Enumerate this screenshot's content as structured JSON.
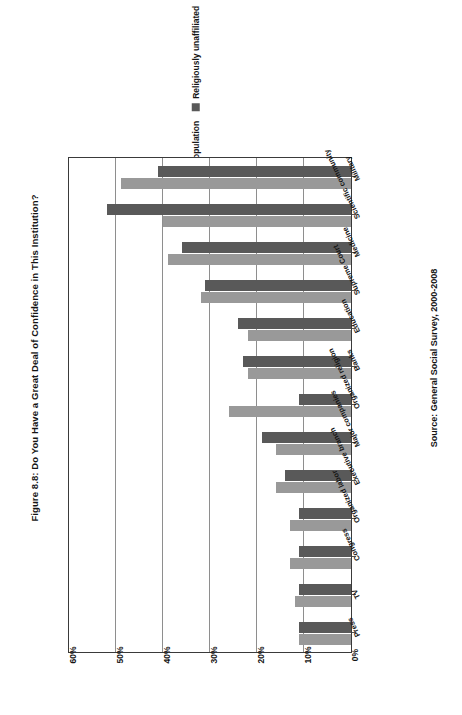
{
  "figure": {
    "title": "Figure 8.8: Do You Have a Great Deal of Confidence in This Institution?",
    "source": "Source: General Social Survey, 2000-2008"
  },
  "legend": {
    "position": "top-center-rotated",
    "items": [
      {
        "label": "General population",
        "color": "#999999"
      },
      {
        "label": "Religiously unaffiliated",
        "color": "#595959"
      }
    ]
  },
  "chart_data": {
    "type": "bar",
    "orientation": "rotated-horizontal",
    "title": "Figure 8.8: Do You Have a Great Deal of Confidence in This Institution?",
    "xlabel": "",
    "ylabel": "",
    "ylim": [
      0,
      60
    ],
    "grid": true,
    "value_axis_ticks": [
      "0%",
      "10%",
      "20%",
      "30%",
      "40%",
      "50%",
      "60%"
    ],
    "value_axis_tick_values": [
      0,
      10,
      20,
      30,
      40,
      50,
      60
    ],
    "value_axis_direction": "right-to-left",
    "legend_position": "top",
    "categories": [
      "Military",
      "Scientific community",
      "Medicine",
      "Supreme Court",
      "Education",
      "Banks",
      "Organized religion",
      "Major companies",
      "Executive branch",
      "Organized labor",
      "Congress",
      "TV",
      "Press"
    ],
    "series": [
      {
        "name": "General population",
        "color": "#999999",
        "values": [
          49,
          40,
          39,
          32,
          22,
          22,
          26,
          16,
          16,
          13,
          13,
          12,
          11
        ]
      },
      {
        "name": "Religiously unaffiliated",
        "color": "#595959",
        "values": [
          41,
          52,
          36,
          31,
          24,
          23,
          11,
          19,
          14,
          11,
          11,
          11,
          11
        ]
      }
    ]
  }
}
